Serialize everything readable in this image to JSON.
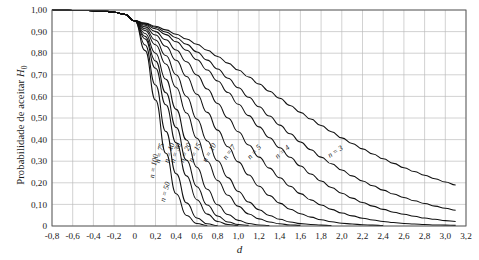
{
  "chart_data": {
    "type": "line",
    "title": "",
    "xlabel": "d",
    "ylabel": "Probabilidade de aceitar H0",
    "ylabel_html": "Probabilidade de aceitar <i>H</i><sub>0</sub>",
    "xlim": [
      -0.8,
      3.2
    ],
    "ylim": [
      0,
      1.0
    ],
    "grid": true,
    "legend_position": "inline-curve-labels",
    "xticks": [
      -0.8,
      -0.6,
      -0.4,
      -0.2,
      0,
      0.2,
      0.4,
      0.6,
      0.8,
      1.0,
      1.2,
      1.4,
      1.6,
      1.8,
      2.0,
      2.2,
      2.4,
      2.6,
      2.8,
      3.0,
      3.2
    ],
    "xticklabels": [
      "-0,8",
      "-0,6",
      "-0,4",
      "-0,2",
      "0",
      "0,2",
      "0,4",
      "0,6",
      "0,8",
      "1,0",
      "1,2",
      "1,4",
      "1,6",
      "1,8",
      "2,0",
      "2,2",
      "2,4",
      "2,6",
      "2,8",
      "3,0",
      "3,2"
    ],
    "yticks": [
      0,
      0.1,
      0.2,
      0.3,
      0.4,
      0.5,
      0.6,
      0.7,
      0.8,
      0.9,
      1.0
    ],
    "yticklabels": [
      "0",
      "0,10",
      "0,20",
      "0,30",
      "0,40",
      "0,50",
      "0,60",
      "0,70",
      "0,80",
      "0,90",
      "1,00"
    ],
    "x": [
      -0.8,
      -0.7,
      -0.6,
      -0.5,
      -0.4,
      -0.3,
      -0.2,
      -0.1,
      0.0,
      0.1,
      0.2,
      0.3,
      0.4,
      0.5,
      0.6,
      0.7,
      0.8,
      0.9,
      1.0,
      1.1,
      1.2,
      1.3,
      1.4,
      1.5,
      1.6,
      1.7,
      1.8,
      1.9,
      2.0,
      2.1,
      2.2,
      2.3,
      2.4,
      2.5,
      2.6,
      2.7,
      2.8,
      2.9,
      3.0,
      3.1
    ],
    "series": [
      {
        "name": "n = 3",
        "label": "n = 3",
        "n": 3,
        "label_x": 1.95,
        "label_y": 0.335,
        "label_rot": -33,
        "values": [
          0.999,
          0.999,
          0.998,
          0.998,
          0.997,
          0.995,
          0.99,
          0.98,
          0.95,
          0.94,
          0.925,
          0.908,
          0.888,
          0.866,
          0.841,
          0.814,
          0.785,
          0.754,
          0.722,
          0.69,
          0.657,
          0.624,
          0.591,
          0.558,
          0.526,
          0.495,
          0.465,
          0.436,
          0.408,
          0.382,
          0.357,
          0.333,
          0.311,
          0.29,
          0.27,
          0.252,
          0.235,
          0.219,
          0.204,
          0.19
        ]
      },
      {
        "name": "n = 4",
        "label": "n = 4",
        "n": 4,
        "label_x": 1.44,
        "label_y": 0.335,
        "label_rot": -40,
        "values": [
          0.999,
          0.999,
          0.998,
          0.998,
          0.997,
          0.995,
          0.99,
          0.98,
          0.95,
          0.937,
          0.92,
          0.898,
          0.872,
          0.841,
          0.806,
          0.768,
          0.727,
          0.684,
          0.64,
          0.596,
          0.552,
          0.509,
          0.467,
          0.427,
          0.389,
          0.353,
          0.319,
          0.288,
          0.259,
          0.232,
          0.208,
          0.186,
          0.166,
          0.148,
          0.132,
          0.117,
          0.104,
          0.092,
          0.082,
          0.073
        ]
      },
      {
        "name": "n = 5",
        "label": "n = 5",
        "n": 5,
        "label_x": 1.17,
        "label_y": 0.335,
        "label_rot": -47,
        "values": [
          0.999,
          0.999,
          0.998,
          0.998,
          0.997,
          0.995,
          0.99,
          0.98,
          0.95,
          0.934,
          0.913,
          0.886,
          0.853,
          0.814,
          0.77,
          0.722,
          0.671,
          0.618,
          0.564,
          0.511,
          0.459,
          0.409,
          0.362,
          0.318,
          0.278,
          0.241,
          0.208,
          0.178,
          0.152,
          0.129,
          0.109,
          0.092,
          0.077,
          0.064,
          0.054,
          0.045,
          0.037,
          0.031,
          0.025,
          0.021
        ]
      },
      {
        "name": "n = 7",
        "label": "n = 7",
        "n": 7,
        "label_x": 0.93,
        "label_y": 0.335,
        "label_rot": -54,
        "values": [
          0.999,
          0.999,
          0.998,
          0.998,
          0.997,
          0.995,
          0.99,
          0.98,
          0.95,
          0.929,
          0.9,
          0.862,
          0.815,
          0.76,
          0.699,
          0.634,
          0.567,
          0.5,
          0.436,
          0.375,
          0.319,
          0.268,
          0.223,
          0.184,
          0.15,
          0.121,
          0.097,
          0.077,
          0.06,
          0.047,
          0.036,
          0.028,
          0.021,
          0.016,
          0.012,
          0.009,
          0.007,
          0.005,
          0.004,
          0.003
        ]
      },
      {
        "name": "n = 10",
        "label": "n = 10",
        "n": 10,
        "label_x": 0.74,
        "label_y": 0.335,
        "label_rot": -60,
        "values": [
          0.999,
          0.999,
          0.998,
          0.998,
          0.997,
          0.995,
          0.99,
          0.98,
          0.95,
          0.922,
          0.884,
          0.832,
          0.767,
          0.692,
          0.61,
          0.526,
          0.444,
          0.367,
          0.297,
          0.236,
          0.184,
          0.141,
          0.106,
          0.078,
          0.057,
          0.041,
          0.029,
          0.02,
          0.013,
          0.009,
          0.006,
          0.004,
          0.002,
          0.002,
          0.001,
          0.001,
          0.0,
          0.0,
          0.0,
          0.0
        ]
      },
      {
        "name": "n = 15",
        "label": "n = 15",
        "n": 15,
        "label_x": 0.6,
        "label_y": 0.335,
        "label_rot": -64,
        "values": [
          0.999,
          0.999,
          0.998,
          0.998,
          0.997,
          0.995,
          0.99,
          0.98,
          0.95,
          0.913,
          0.861,
          0.789,
          0.7,
          0.6,
          0.495,
          0.394,
          0.302,
          0.224,
          0.16,
          0.111,
          0.075,
          0.049,
          0.031,
          0.019,
          0.011,
          0.007,
          0.004,
          0.002,
          0.001,
          0.001,
          0.0,
          0.0,
          0.0,
          0.0,
          0.0,
          0.0,
          0.0,
          0.0,
          0.0,
          0.0
        ]
      },
      {
        "name": "n = 20",
        "label": "n = 20",
        "n": 20,
        "label_x": 0.51,
        "label_y": 0.335,
        "label_rot": -67,
        "values": [
          0.999,
          0.999,
          0.998,
          0.998,
          0.997,
          0.995,
          0.99,
          0.98,
          0.95,
          0.905,
          0.839,
          0.75,
          0.641,
          0.523,
          0.406,
          0.3,
          0.211,
          0.142,
          0.091,
          0.056,
          0.033,
          0.019,
          0.01,
          0.005,
          0.003,
          0.001,
          0.001,
          0.0,
          0.0,
          0.0,
          0.0,
          0.0,
          0.0,
          0.0,
          0.0,
          0.0,
          0.0,
          0.0,
          0.0,
          0.0
        ]
      },
      {
        "name": "n = 30",
        "label": "n = 30",
        "n": 30,
        "label_x": 0.415,
        "label_y": 0.335,
        "label_rot": -71,
        "values": [
          0.999,
          0.999,
          0.998,
          0.998,
          0.997,
          0.995,
          0.99,
          0.98,
          0.95,
          0.891,
          0.8,
          0.679,
          0.54,
          0.398,
          0.272,
          0.17,
          0.098,
          0.053,
          0.026,
          0.012,
          0.005,
          0.002,
          0.001,
          0.0,
          0.0,
          0.0,
          0.0,
          0.0,
          0.0,
          0.0,
          0.0,
          0.0,
          0.0,
          0.0,
          0.0,
          0.0,
          0.0,
          0.0,
          0.0,
          0.0
        ]
      },
      {
        "name": "n = 40",
        "label": "n = 40",
        "n": 40,
        "label_x": 0.355,
        "label_y": 0.335,
        "label_rot": -73,
        "values": [
          0.999,
          0.999,
          0.998,
          0.998,
          0.997,
          0.995,
          0.99,
          0.98,
          0.95,
          0.878,
          0.764,
          0.617,
          0.456,
          0.305,
          0.182,
          0.097,
          0.046,
          0.019,
          0.007,
          0.003,
          0.001,
          0.0,
          0.0,
          0.0,
          0.0,
          0.0,
          0.0,
          0.0,
          0.0,
          0.0,
          0.0,
          0.0,
          0.0,
          0.0,
          0.0,
          0.0,
          0.0,
          0.0,
          0.0,
          0.0
        ]
      },
      {
        "name": "n = 50",
        "label": "n = 50",
        "n": 50,
        "label_x": 0.315,
        "label_y": 0.155,
        "label_rot": -75,
        "values": [
          0.999,
          0.999,
          0.998,
          0.998,
          0.997,
          0.995,
          0.99,
          0.98,
          0.95,
          0.866,
          0.73,
          0.561,
          0.385,
          0.232,
          0.122,
          0.055,
          0.021,
          0.007,
          0.002,
          0.001,
          0.0,
          0.0,
          0.0,
          0.0,
          0.0,
          0.0,
          0.0,
          0.0,
          0.0,
          0.0,
          0.0,
          0.0,
          0.0,
          0.0,
          0.0,
          0.0,
          0.0,
          0.0,
          0.0,
          0.0
        ]
      },
      {
        "name": "n = 75",
        "label": "n = 75",
        "n": 75,
        "label_x": 0.262,
        "label_y": 0.335,
        "label_rot": -78,
        "values": [
          0.999,
          0.999,
          0.998,
          0.998,
          0.997,
          0.995,
          0.99,
          0.98,
          0.95,
          0.838,
          0.653,
          0.438,
          0.242,
          0.107,
          0.037,
          0.01,
          0.002,
          0.0,
          0.0,
          0.0,
          0.0,
          0.0,
          0.0,
          0.0,
          0.0,
          0.0,
          0.0,
          0.0,
          0.0,
          0.0,
          0.0,
          0.0,
          0.0,
          0.0,
          0.0,
          0.0,
          0.0,
          0.0,
          0.0,
          0.0
        ]
      },
      {
        "name": "n = 100",
        "label": "n = 100",
        "n": 100,
        "label_x": 0.205,
        "label_y": 0.275,
        "label_rot": -80,
        "values": [
          0.999,
          0.999,
          0.998,
          0.998,
          0.997,
          0.995,
          0.99,
          0.98,
          0.95,
          0.812,
          0.583,
          0.337,
          0.149,
          0.049,
          0.012,
          0.002,
          0.0,
          0.0,
          0.0,
          0.0,
          0.0,
          0.0,
          0.0,
          0.0,
          0.0,
          0.0,
          0.0,
          0.0,
          0.0,
          0.0,
          0.0,
          0.0,
          0.0,
          0.0,
          0.0,
          0.0,
          0.0,
          0.0,
          0.0,
          0.0
        ]
      }
    ]
  }
}
